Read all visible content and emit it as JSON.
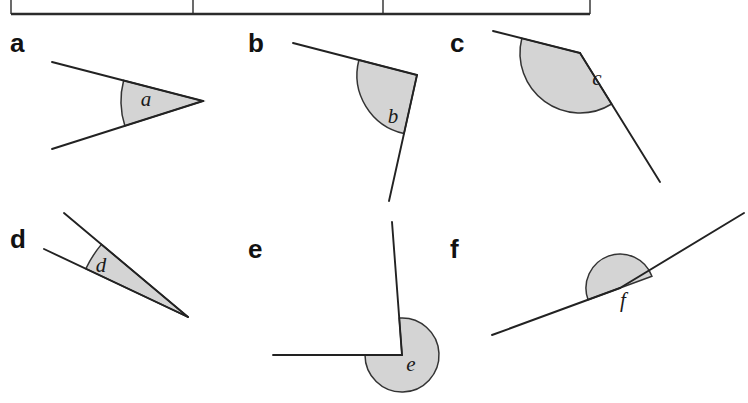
{
  "page": {
    "width": 748,
    "height": 403,
    "background": "#ffffff",
    "kind": "angles-worksheet-scan"
  },
  "table_remnant": {
    "description": "bottom border of a three-column table cut off at top of page",
    "stroke_color": "#2b2b2b",
    "bottom_y": 14,
    "left_x": 11,
    "right_x": 590,
    "column_divider_x": [
      193,
      383
    ],
    "tick_height": 14
  },
  "style": {
    "shade_fill": "#d4d4d4",
    "shade_stroke": "#333333",
    "ray_stroke": "#222222",
    "label_color": "#121212",
    "letter_color": "#1a1a1a"
  },
  "figures": [
    {
      "id": "a",
      "label": "a",
      "letter": "a",
      "label_pos": {
        "x": 10,
        "y": 52
      },
      "letter_pos": {
        "x": 146,
        "y": 101
      },
      "vertex": {
        "x": 203,
        "y": 101
      },
      "ray1_end": {
        "x": 52,
        "y": 62
      },
      "ray2_end": {
        "x": 52,
        "y": 149
      },
      "arc_radius": 82,
      "angle_type": "acute",
      "angle_degrees": 35
    },
    {
      "id": "b",
      "label": "b",
      "letter": "b",
      "label_pos": {
        "x": 248,
        "y": 52
      },
      "letter_pos": {
        "x": 393,
        "y": 118
      },
      "vertex": {
        "x": 417,
        "y": 75
      },
      "ray1_end": {
        "x": 293,
        "y": 43
      },
      "ray2_end": {
        "x": 389,
        "y": 201
      },
      "arc_radius": 60,
      "angle_type": "obtuse",
      "angle_degrees": 103
    },
    {
      "id": "c",
      "label": "c",
      "letter": "c",
      "label_pos": {
        "x": 450,
        "y": 52
      },
      "letter_pos": {
        "x": 597,
        "y": 80
      },
      "vertex": {
        "x": 580,
        "y": 53
      },
      "ray1_end": {
        "x": 493,
        "y": 31
      },
      "ray2_end": {
        "x": 660,
        "y": 182
      },
      "arc_radius": 60,
      "angle_type": "obtuse",
      "angle_degrees": 140
    },
    {
      "id": "d",
      "label": "d",
      "letter": "d",
      "label_pos": {
        "x": 10,
        "y": 248
      },
      "letter_pos": {
        "x": 101,
        "y": 267
      },
      "vertex": {
        "x": 188,
        "y": 317
      },
      "ray1_end": {
        "x": 64,
        "y": 213
      },
      "ray2_end": {
        "x": 44,
        "y": 249
      },
      "arc_radius": 113,
      "angle_type": "acute",
      "angle_degrees": 18
    },
    {
      "id": "e",
      "label": "e",
      "letter": "e",
      "label_pos": {
        "x": 248,
        "y": 258
      },
      "letter_pos": {
        "x": 411,
        "y": 366
      },
      "vertex": {
        "x": 402,
        "y": 355
      },
      "ray1_end": {
        "x": 392,
        "y": 222
      },
      "ray2_end": {
        "x": 273,
        "y": 355
      },
      "arc_radius": 37,
      "angle_type": "reflex",
      "angle_degrees": 266
    },
    {
      "id": "f",
      "label": "f",
      "letter": "f",
      "label_pos": {
        "x": 450,
        "y": 258
      },
      "letter_pos": {
        "x": 623,
        "y": 302
      },
      "vertex": {
        "x": 620,
        "y": 288
      },
      "ray1_end": {
        "x": 744,
        "y": 213
      },
      "ray2_end": {
        "x": 492,
        "y": 335
      },
      "arc_radius": 34,
      "angle_type": "straight",
      "angle_degrees": 180
    }
  ]
}
